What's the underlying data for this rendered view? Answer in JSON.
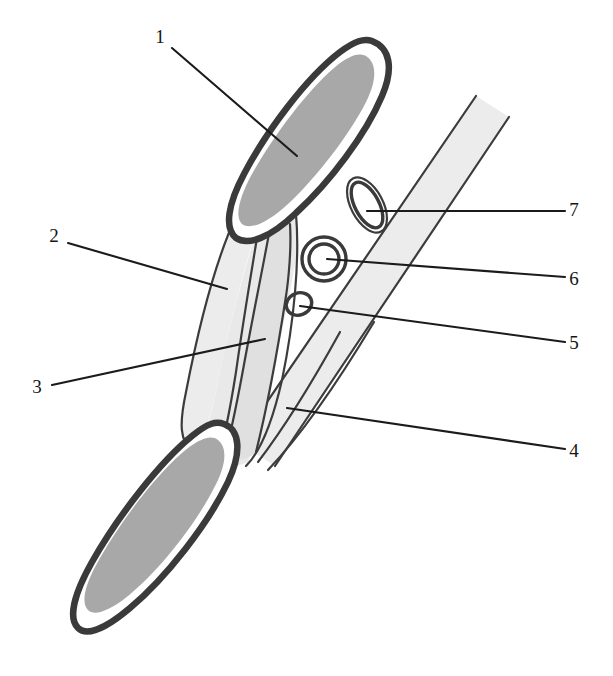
{
  "figure": {
    "background_color": "#ffffff",
    "width": 613,
    "height": 676,
    "colors": {
      "outline_dark": "#3a3a3a",
      "fill_medium_gray": "#a8a8a8",
      "fill_light_gray": "#ececec",
      "fill_pale_gray": "#e3e3e3",
      "leader_line": "#1b1b1b",
      "label_text": "#151515",
      "white": "#ffffff"
    },
    "labels": [
      {
        "id": "1",
        "text": "1",
        "x": 160,
        "y": 39,
        "side": "left",
        "leader": "M 172 48 L 297 156"
      },
      {
        "id": "2",
        "text": "2",
        "x": 54,
        "y": 238,
        "side": "left",
        "leader": "M 68 243 L 227 289"
      },
      {
        "id": "3",
        "text": "3",
        "x": 37,
        "y": 389,
        "side": "left",
        "leader": "M 52 385 L 265 339"
      },
      {
        "id": "4",
        "text": "4",
        "x": 574,
        "y": 453,
        "side": "right",
        "leader": "M 565 449 L 287 408"
      },
      {
        "id": "5",
        "text": "5",
        "x": 574,
        "y": 345,
        "side": "right",
        "leader": "M 565 342 L 300 306"
      },
      {
        "id": "6",
        "text": "6",
        "x": 574,
        "y": 281,
        "side": "right",
        "leader": "M 565 277 L 327 259"
      },
      {
        "id": "7",
        "text": "7",
        "x": 574,
        "y": 212,
        "side": "right",
        "leader": "M 565 211 L 367 211"
      }
    ],
    "structures": [
      {
        "name": "upper-leaf-body",
        "label_ref": "1",
        "description": "large upper elongated leaf-shaped body, dark outline, medium gray interior with white rim"
      },
      {
        "name": "lower-leaf-body",
        "label_ref": "1",
        "description": "large lower elongated leaf-shaped body, dark outline, medium gray interior with white rim"
      },
      {
        "name": "lateral-band",
        "label_ref": "2",
        "description": "pale vertical band on left of central shaft"
      },
      {
        "name": "central-cord",
        "label_ref": "3",
        "description": "narrow central cord running between upper and lower bodies"
      },
      {
        "name": "oblique-strap",
        "label_ref": "4",
        "description": "broad oblique pale strap running to upper right"
      },
      {
        "name": "small-oval",
        "label_ref": "5",
        "description": "smallest oval profile, thin outline, light fill"
      },
      {
        "name": "ring-circle",
        "label_ref": "6",
        "description": "round ring profile, thick outline, light gray lumen"
      },
      {
        "name": "tilted-ellipse",
        "label_ref": "7",
        "description": "tilted elongated ellipse profile, double outline, light gray lumen"
      }
    ]
  }
}
